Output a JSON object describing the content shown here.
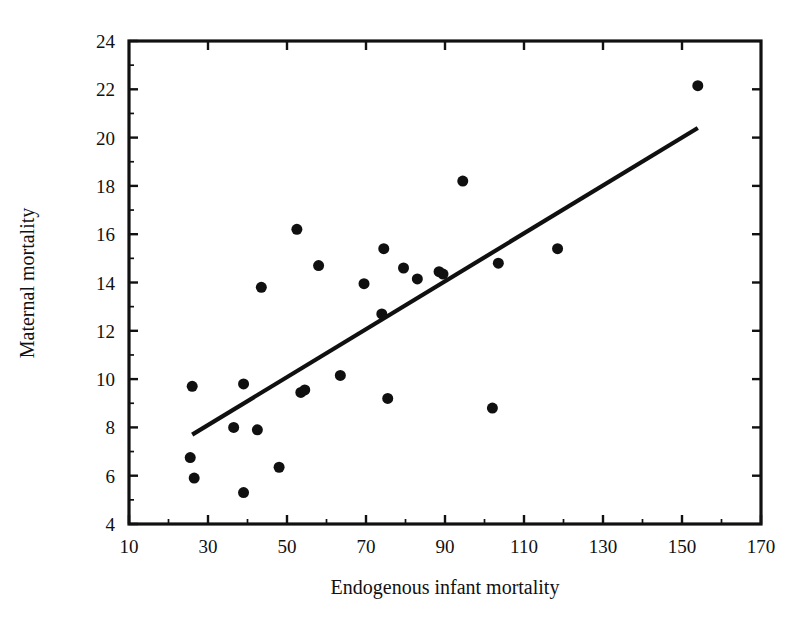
{
  "chart_data": {
    "type": "scatter",
    "title": "",
    "xlabel": "Endogenous infant mortality",
    "ylabel": "Maternal mortality",
    "xlim": [
      10,
      170
    ],
    "ylim": [
      4,
      24
    ],
    "x_major_ticks": [
      10,
      30,
      50,
      70,
      90,
      110,
      130,
      150,
      170
    ],
    "x_minor_ticks": [
      20,
      40,
      60,
      80,
      100,
      120,
      140,
      160
    ],
    "y_major_ticks": [
      4,
      6,
      8,
      10,
      12,
      14,
      16,
      18,
      20,
      22,
      24
    ],
    "y_minor_ticks": [
      5,
      7,
      9,
      11,
      13,
      15,
      17,
      19,
      21,
      23
    ],
    "x_tick_labels": [
      "10",
      "30",
      "50",
      "70",
      "90",
      "110",
      "130",
      "150",
      "170"
    ],
    "y_tick_labels": [
      "4",
      "6",
      "8",
      "10",
      "12",
      "14",
      "16",
      "18",
      "20",
      "22",
      "24"
    ],
    "grid": false,
    "legend": false,
    "marker": "filled-circle",
    "marker_color": "#101010",
    "marker_size_px": 11,
    "points": [
      {
        "x": 26.0,
        "y": 9.7
      },
      {
        "x": 25.5,
        "y": 6.75
      },
      {
        "x": 26.5,
        "y": 5.9
      },
      {
        "x": 36.5,
        "y": 8.0
      },
      {
        "x": 39.0,
        "y": 9.8
      },
      {
        "x": 39.0,
        "y": 5.3
      },
      {
        "x": 42.5,
        "y": 7.9
      },
      {
        "x": 43.5,
        "y": 13.8
      },
      {
        "x": 48.0,
        "y": 6.35
      },
      {
        "x": 52.5,
        "y": 16.2
      },
      {
        "x": 53.5,
        "y": 9.45
      },
      {
        "x": 54.5,
        "y": 9.55
      },
      {
        "x": 58.0,
        "y": 14.7
      },
      {
        "x": 63.5,
        "y": 10.15
      },
      {
        "x": 69.5,
        "y": 13.95
      },
      {
        "x": 74.5,
        "y": 15.4
      },
      {
        "x": 74.0,
        "y": 12.7
      },
      {
        "x": 75.5,
        "y": 9.2
      },
      {
        "x": 79.5,
        "y": 14.6
      },
      {
        "x": 83.0,
        "y": 14.15
      },
      {
        "x": 88.5,
        "y": 14.45
      },
      {
        "x": 89.5,
        "y": 14.35
      },
      {
        "x": 94.5,
        "y": 18.2
      },
      {
        "x": 102.0,
        "y": 8.8
      },
      {
        "x": 103.5,
        "y": 14.8
      },
      {
        "x": 118.5,
        "y": 15.4
      },
      {
        "x": 154.0,
        "y": 22.15
      }
    ],
    "fit_line": {
      "type": "linear-regression",
      "x_start": 26.0,
      "y_start": 7.7,
      "x_end": 154.0,
      "y_end": 20.4,
      "color": "#101010"
    }
  },
  "axes": {
    "x_axis_label": "Endogenous infant mortality",
    "y_axis_label": "Maternal mortality"
  },
  "icons": {
    "scatter_marker": "filled-circle-marker",
    "trend_line": "trend-line"
  }
}
